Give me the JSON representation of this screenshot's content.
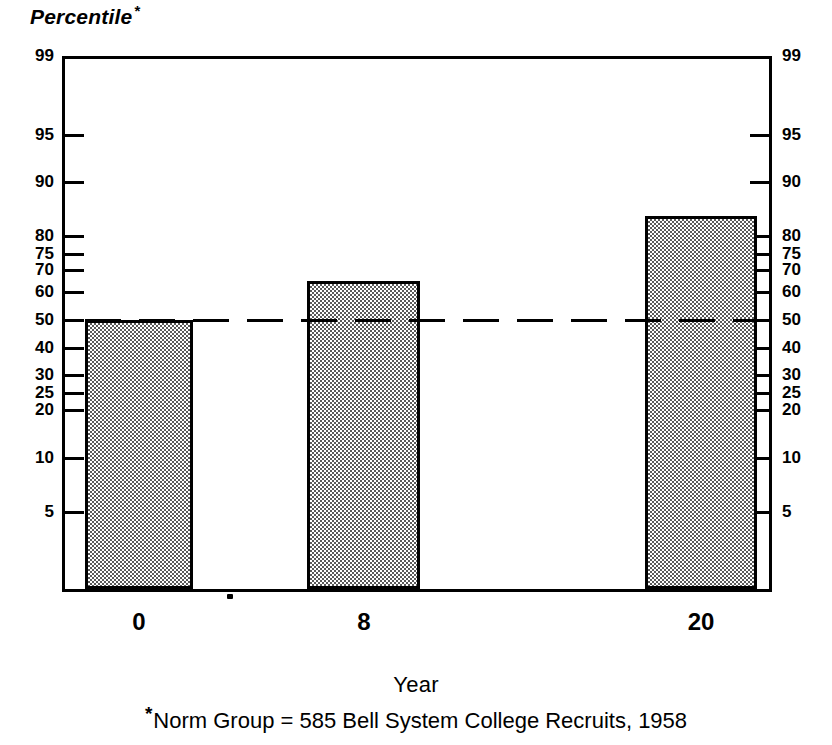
{
  "chart_data": {
    "type": "bar",
    "title": "",
    "ylabel": "Percentile",
    "ylabel_superscript": "*",
    "xlabel": "Year",
    "categories": [
      "0",
      "8",
      "20"
    ],
    "values": [
      49,
      65,
      82
    ],
    "ylim": [
      1,
      99
    ],
    "yscale": "normal-probability",
    "ytick_labels": [
      "99",
      "95",
      "90",
      "80",
      "75",
      "70",
      "60",
      "50",
      "40",
      "30",
      "25",
      "20",
      "10",
      "5"
    ],
    "ytick_values": [
      99,
      95,
      90,
      80,
      75,
      70,
      60,
      50,
      40,
      30,
      25,
      20,
      10,
      5
    ],
    "ytick_positions_px": [
      56,
      135,
      182,
      236,
      254,
      270,
      292,
      320,
      348,
      375,
      393,
      410,
      458,
      512
    ],
    "axis_labels_both_sides": true,
    "grid": false,
    "legend": null,
    "reference_line": {
      "value": 50,
      "style": "dashed",
      "label": ""
    },
    "annotations": [
      "*Norm Group = 585 Bell System College Recruits, 1958"
    ],
    "bar_fill": "checkerboard-gray",
    "bar_edge_color": "#000000",
    "footnote": "Norm Group = 585 Bell System College Recruits, 1958",
    "footnote_mark": "*"
  },
  "bars": [
    {
      "category": "0",
      "value": 49,
      "left_px": 85,
      "width_px": 108,
      "top_px": 320,
      "bottom_px": 589
    },
    {
      "category": "8",
      "value": 65,
      "left_px": 307,
      "width_px": 113,
      "top_px": 281,
      "bottom_px": 589
    },
    {
      "category": "20",
      "value": 82,
      "left_px": 645,
      "width_px": 112,
      "top_px": 216,
      "bottom_px": 589
    }
  ],
  "x_tick_labels": [
    {
      "label": "0",
      "center_px": 139
    },
    {
      "label": "8",
      "center_px": 364
    },
    {
      "label": "20",
      "center_px": 701
    }
  ],
  "colors": {
    "background": "#ffffff",
    "ink": "#000000",
    "bar_pattern": "#5a5a5a"
  }
}
